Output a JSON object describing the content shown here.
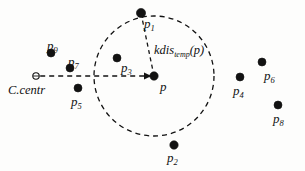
{
  "figure": {
    "kind": "geometric-point-diagram",
    "background_color": "#fdfdfc",
    "ink_color": "#121212",
    "width": 305,
    "height": 171
  },
  "chart_data": {
    "type": "scatter",
    "title": "",
    "xlabel": "",
    "ylabel": "",
    "xlim": [
      0,
      305
    ],
    "ylim": [
      0,
      171
    ],
    "grid": false,
    "legend": "none",
    "points": [
      {
        "id": "p",
        "label": "p",
        "subscript": "",
        "x": 154,
        "y": 76,
        "label_x": 160,
        "label_y": 80,
        "filled": true,
        "radius": 4.2
      },
      {
        "id": "p1",
        "label": "p",
        "subscript": "1",
        "x": 141,
        "y": 13,
        "label_x": 144,
        "label_y": 17,
        "filled": true,
        "radius": 4.6
      },
      {
        "id": "p2",
        "label": "p",
        "subscript": "2",
        "x": 174,
        "y": 145,
        "label_x": 167,
        "label_y": 151,
        "filled": true,
        "radius": 4.2
      },
      {
        "id": "p3",
        "label": "p",
        "subscript": "3",
        "x": 117,
        "y": 58,
        "label_x": 121,
        "label_y": 61,
        "filled": true,
        "radius": 4.0
      },
      {
        "id": "p4",
        "label": "p",
        "subscript": "4",
        "x": 240,
        "y": 77,
        "label_x": 233,
        "label_y": 84,
        "filled": true,
        "radius": 4.0
      },
      {
        "id": "p5",
        "label": "p",
        "subscript": "5",
        "x": 78,
        "y": 88,
        "label_x": 71,
        "label_y": 95,
        "filled": true,
        "radius": 4.0
      },
      {
        "id": "p6",
        "label": "p",
        "subscript": "6",
        "x": 262,
        "y": 62,
        "label_x": 264,
        "label_y": 69,
        "filled": true,
        "radius": 4.0
      },
      {
        "id": "p7",
        "label": "p",
        "subscript": "7",
        "x": 70,
        "y": 68,
        "label_x": 68,
        "label_y": 55,
        "filled": true,
        "radius": 4.0
      },
      {
        "id": "p8",
        "label": "p",
        "subscript": "8",
        "x": 278,
        "y": 105,
        "label_x": 273,
        "label_y": 112,
        "filled": true,
        "radius": 4.0
      },
      {
        "id": "p9",
        "label": "p",
        "subscript": "9",
        "x": 51,
        "y": 53,
        "label_x": 47,
        "label_y": 39,
        "filled": true,
        "radius": 4.0
      }
    ],
    "cluster_center": {
      "id": "c-centr",
      "label": "C.centr",
      "x": 36,
      "y": 76,
      "marker": "open-circle",
      "radius": 3.2,
      "label_x": 8,
      "label_y": 84
    },
    "circle": {
      "id": "kdist-circle",
      "center_x": 154,
      "center_y": 76,
      "radius": 60,
      "style": "dashed",
      "dash": "5,4",
      "stroke_width": 1.3
    },
    "radius_segment": {
      "id": "kdist-radius",
      "from": "p",
      "to": "p1",
      "style": "dashed",
      "dash": "4,3.5",
      "stroke_width": 1.3
    },
    "center_segment": {
      "id": "center-to-p",
      "from": "c-centr",
      "to": "p",
      "style": "dashed",
      "dash": "5,4",
      "stroke_width": 1.4,
      "arrowhead": true
    },
    "annotations": [
      {
        "id": "kdist-annotation",
        "text_prefix": "kdis",
        "text_subscript": "temp",
        "text_suffix": "(p)",
        "x": 154,
        "y": 44
      }
    ]
  },
  "labels": {
    "center": "C.centr",
    "distance_prefix": "kdis",
    "distance_subscript": "temp",
    "distance_suffix": "(p)"
  }
}
